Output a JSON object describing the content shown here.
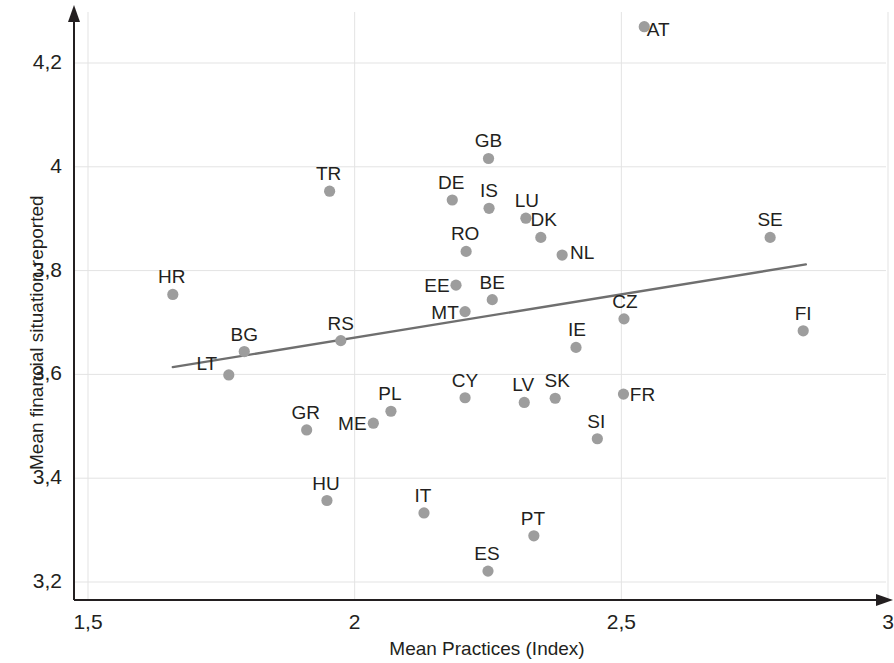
{
  "chart_data": {
    "type": "scatter",
    "title": "",
    "xlabel": "Mean Practices (Index)",
    "ylabel": "Mean financial situation reported",
    "xlim": [
      1.5,
      3.0
    ],
    "ylim": [
      3.2,
      4.3
    ],
    "xticks": [
      "1,5",
      "2",
      "2,5",
      "3"
    ],
    "xtick_values": [
      1.5,
      2.0,
      2.5,
      3.0
    ],
    "yticks": [
      "3,2",
      "3,4",
      "3,6",
      "3,8",
      "4",
      "4,2"
    ],
    "ytick_values": [
      3.2,
      3.4,
      3.6,
      3.8,
      4.0,
      4.2
    ],
    "grid": true,
    "legend": "none",
    "point_color": "#9d9d9d",
    "line_color": "#6f6f6f",
    "axis_color": "#231f20",
    "grid_color": "#e3e3e3",
    "points": [
      {
        "label": "AT",
        "x": 2.543,
        "y": 4.27,
        "lx": 14,
        "ly": 1
      },
      {
        "label": "GB",
        "x": 2.251,
        "y": 4.016,
        "lx": 0,
        "ly": -19
      },
      {
        "label": "TR",
        "x": 1.953,
        "y": 3.953,
        "lx": -1,
        "ly": -19
      },
      {
        "label": "DE",
        "x": 2.183,
        "y": 3.936,
        "lx": -1,
        "ly": -19
      },
      {
        "label": "IS",
        "x": 2.252,
        "y": 3.92,
        "lx": 0,
        "ly": -19
      },
      {
        "label": "LU",
        "x": 2.321,
        "y": 3.901,
        "lx": 1,
        "ly": -19
      },
      {
        "label": "DK",
        "x": 2.349,
        "y": 3.864,
        "lx": 3,
        "ly": -19
      },
      {
        "label": "SE",
        "x": 2.779,
        "y": 3.864,
        "lx": 0,
        "ly": -19
      },
      {
        "label": "RO",
        "x": 2.209,
        "y": 3.837,
        "lx": -1,
        "ly": -19
      },
      {
        "label": "NL",
        "x": 2.389,
        "y": 3.83,
        "lx": 20,
        "ly": -4
      },
      {
        "label": "HR",
        "x": 1.659,
        "y": 3.754,
        "lx": -1,
        "ly": -19
      },
      {
        "label": "BE",
        "x": 2.258,
        "y": 3.744,
        "lx": 0,
        "ly": -19
      },
      {
        "label": "EE",
        "x": 2.19,
        "y": 3.772,
        "lx": -19,
        "ly": -1
      },
      {
        "label": "MT",
        "x": 2.207,
        "y": 3.721,
        "lx": -20,
        "ly": -1
      },
      {
        "label": "CZ",
        "x": 2.505,
        "y": 3.707,
        "lx": 1,
        "ly": -19
      },
      {
        "label": "FI",
        "x": 2.841,
        "y": 3.684,
        "lx": 0,
        "ly": -19
      },
      {
        "label": "RS",
        "x": 1.974,
        "y": 3.665,
        "lx": 0,
        "ly": -19
      },
      {
        "label": "IE",
        "x": 2.415,
        "y": 3.652,
        "lx": 1,
        "ly": -19
      },
      {
        "label": "BG",
        "x": 1.793,
        "y": 3.644,
        "lx": 0,
        "ly": -19
      },
      {
        "label": "LT",
        "x": 1.764,
        "y": 3.599,
        "lx": -22,
        "ly": -13
      },
      {
        "label": "FR",
        "x": 2.504,
        "y": 3.562,
        "lx": 19,
        "ly": -1
      },
      {
        "label": "CY",
        "x": 2.207,
        "y": 3.555,
        "lx": 0,
        "ly": -19
      },
      {
        "label": "SK",
        "x": 2.376,
        "y": 3.554,
        "lx": 2,
        "ly": -19
      },
      {
        "label": "LV",
        "x": 2.318,
        "y": 3.546,
        "lx": -1,
        "ly": -19
      },
      {
        "label": "PL",
        "x": 2.068,
        "y": 3.529,
        "lx": -1,
        "ly": -19
      },
      {
        "label": "ME",
        "x": 2.035,
        "y": 3.506,
        "lx": -21,
        "ly": -1
      },
      {
        "label": "GR",
        "x": 1.91,
        "y": 3.493,
        "lx": -1,
        "ly": -19
      },
      {
        "label": "SI",
        "x": 2.455,
        "y": 3.476,
        "lx": -1,
        "ly": -19
      },
      {
        "label": "HU",
        "x": 1.948,
        "y": 3.357,
        "lx": -1,
        "ly": -19
      },
      {
        "label": "IT",
        "x": 2.13,
        "y": 3.333,
        "lx": -1,
        "ly": -19
      },
      {
        "label": "PT",
        "x": 2.336,
        "y": 3.289,
        "lx": -1,
        "ly": -19
      },
      {
        "label": "ES",
        "x": 2.25,
        "y": 3.221,
        "lx": -1,
        "ly": -19
      }
    ],
    "trendline": {
      "x0": 1.659,
      "y0": 3.614,
      "x1": 2.846,
      "y1": 3.812
    }
  }
}
